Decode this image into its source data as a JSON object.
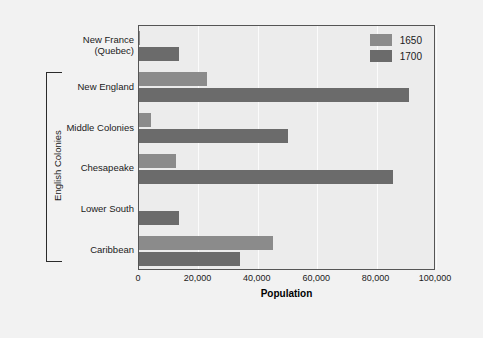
{
  "chart_data": {
    "type": "bar",
    "orientation": "horizontal",
    "title": "",
    "xlabel": "Population",
    "ylabel": "",
    "xlim": [
      0,
      100000
    ],
    "xticks": [
      0,
      20000,
      40000,
      60000,
      80000,
      100000
    ],
    "xtick_labels": [
      "0",
      "20,000",
      "40,000",
      "60,000",
      "80,000",
      "100,000"
    ],
    "grid": true,
    "legend_position": "top-right",
    "categories": [
      "New France\n(Quebec)",
      "New England",
      "Middle Colonies",
      "Chesapeake",
      "Lower South",
      "Caribbean"
    ],
    "category_lines": [
      [
        "New France",
        "(Quebec)"
      ],
      [
        "New England"
      ],
      [
        "Middle Colonies"
      ],
      [
        "Chesapeake"
      ],
      [
        "Lower South"
      ],
      [
        "Caribbean"
      ]
    ],
    "series": [
      {
        "name": "1650",
        "color": "#8b8b8b",
        "values": [
          500,
          23000,
          4000,
          12500,
          0,
          45000
        ]
      },
      {
        "name": "1700",
        "color": "#6b6b6b",
        "values": [
          13500,
          91000,
          50000,
          85500,
          13500,
          34000
        ]
      }
    ],
    "group_annotation": {
      "label": "English Colonies",
      "covers": [
        "New England",
        "Middle Colonies",
        "Chesapeake",
        "Lower South",
        "Caribbean"
      ]
    }
  },
  "legend": {
    "entries": [
      {
        "label": "1650",
        "color": "#8b8b8b"
      },
      {
        "label": "1700",
        "color": "#6b6b6b"
      }
    ]
  },
  "axis": {
    "x_title": "Population"
  },
  "colors": {
    "series_1650": "#8b8b8b",
    "series_1700": "#6b6b6b",
    "plot_background": "#ececec",
    "figure_background": "#f2f2f2",
    "gridline": "#fbfbfb",
    "frame": "#555555",
    "text": "#1a1a1a"
  }
}
